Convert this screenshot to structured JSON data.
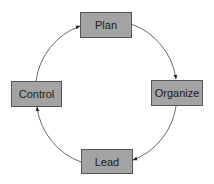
{
  "diagram": {
    "type": "cycle",
    "direction": "clockwise",
    "colors": {
      "box_fill": "#a3a3a3",
      "box_stroke": "#555555",
      "arrow": "#444444",
      "text": "#1a1a1a"
    },
    "nodes": [
      {
        "id": "plan",
        "label": "Plan"
      },
      {
        "id": "organize",
        "label": "Organize"
      },
      {
        "id": "lead",
        "label": "Lead"
      },
      {
        "id": "control",
        "label": "Control"
      }
    ],
    "edges": [
      {
        "from": "plan",
        "to": "organize"
      },
      {
        "from": "organize",
        "to": "lead"
      },
      {
        "from": "lead",
        "to": "control"
      },
      {
        "from": "control",
        "to": "plan"
      }
    ]
  }
}
